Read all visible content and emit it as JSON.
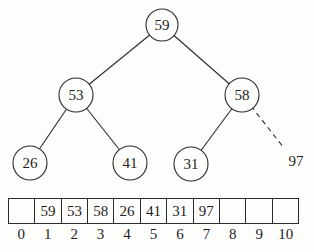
{
  "tree": {
    "nodes": [
      {
        "value": "59"
      },
      {
        "value": "53"
      },
      {
        "value": "58"
      },
      {
        "value": "26"
      },
      {
        "value": "41"
      },
      {
        "value": "31"
      },
      {
        "value": "97"
      }
    ],
    "edges": [
      {
        "from": "59",
        "to": "53",
        "style": "solid"
      },
      {
        "from": "59",
        "to": "58",
        "style": "solid"
      },
      {
        "from": "53",
        "to": "26",
        "style": "solid"
      },
      {
        "from": "53",
        "to": "41",
        "style": "solid"
      },
      {
        "from": "58",
        "to": "31",
        "style": "solid"
      },
      {
        "from": "58",
        "to": "97",
        "style": "dashed"
      }
    ]
  },
  "array": {
    "cells": [
      {
        "index": "0",
        "value": ""
      },
      {
        "index": "1",
        "value": "59"
      },
      {
        "index": "2",
        "value": "53"
      },
      {
        "index": "3",
        "value": "58"
      },
      {
        "index": "4",
        "value": "26"
      },
      {
        "index": "5",
        "value": "41"
      },
      {
        "index": "6",
        "value": "31"
      },
      {
        "index": "7",
        "value": "97"
      },
      {
        "index": "8",
        "value": ""
      },
      {
        "index": "9",
        "value": ""
      },
      {
        "index": "10",
        "value": ""
      }
    ]
  },
  "colors": {
    "ink": "#2b2b2b",
    "background": "#fdfdfc"
  }
}
